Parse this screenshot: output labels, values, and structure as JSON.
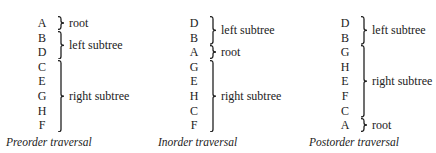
{
  "columns": [
    {
      "caption": "Preorder traversal",
      "letters": [
        "A",
        "B",
        "D",
        "C",
        "E",
        "G",
        "H",
        "F"
      ],
      "groups": [
        {
          "label": "root",
          "from": 0,
          "to": 0
        },
        {
          "label": "left subtree",
          "from": 1,
          "to": 2
        },
        {
          "label": "right subtree",
          "from": 3,
          "to": 7
        }
      ]
    },
    {
      "caption": "Inorder traversal",
      "letters": [
        "D",
        "B",
        "A",
        "G",
        "E",
        "H",
        "C",
        "F"
      ],
      "groups": [
        {
          "label": "left subtree",
          "from": 0,
          "to": 1
        },
        {
          "label": "root",
          "from": 2,
          "to": 2
        },
        {
          "label": "right subtree",
          "from": 3,
          "to": 7
        }
      ]
    },
    {
      "caption": "Postorder traversal",
      "letters": [
        "D",
        "B",
        "G",
        "H",
        "E",
        "F",
        "C",
        "A"
      ],
      "groups": [
        {
          "label": "left subtree",
          "from": 0,
          "to": 1
        },
        {
          "label": "right subtree",
          "from": 2,
          "to": 6
        },
        {
          "label": "root",
          "from": 7,
          "to": 7
        }
      ]
    }
  ]
}
